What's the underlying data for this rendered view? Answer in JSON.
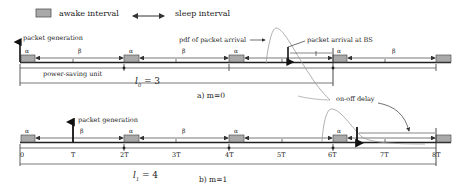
{
  "legend": {
    "awake_label": "awake interval",
    "sleep_label": "sleep interval"
  },
  "colors": {
    "awake_fill": "#a9a9a9",
    "line": "#222222",
    "pdf_curve": "#9a9a9a"
  },
  "diagram_a": {
    "caption": "a) m=0",
    "packet_generation": "packet generation",
    "pdf_label": "pdf of packet arrival",
    "arrival_label": "packet arrival at BS",
    "unit_label": "power-saving unit",
    "length_label": "l",
    "length_sub": "0",
    "length_value": "= 3",
    "alpha": "α",
    "beta": "β"
  },
  "diagram_b": {
    "caption": "b) m=1",
    "packet_generation": "packet generation",
    "delay_label": "on-off delay",
    "length_label": "l",
    "length_sub": "1",
    "length_value": "= 4",
    "alpha": "α",
    "beta": "β",
    "ticks": [
      "0",
      "T",
      "2T",
      "3T",
      "4T",
      "5T",
      "6T",
      "7T",
      "8T"
    ]
  }
}
